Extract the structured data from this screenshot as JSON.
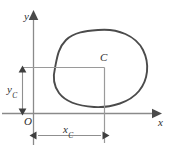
{
  "figure": {
    "kind": "diagram",
    "background_color": "#ffffff",
    "axes": {
      "x_axis_label": "x",
      "y_axis_label": "y",
      "origin_label": "O",
      "axis_color": "#8a8a8a",
      "arrowhead_color": "#4a4a4a"
    },
    "point": {
      "label": "C",
      "name": "centroid",
      "color": "#2e2e2e"
    },
    "dimensions": [
      {
        "id": "x-dimension",
        "label_base": "x",
        "label_subscript": "C",
        "orientation": "horizontal",
        "arrow_style": "double-headed",
        "color": "#8f8f8f"
      },
      {
        "id": "y-dimension",
        "label_base": "y",
        "label_subscript": "C",
        "orientation": "vertical",
        "arrow_style": "double-headed",
        "color": "#8f8f8f"
      }
    ],
    "shape": {
      "name": "closed-irregular-region",
      "stroke_color": "#4b4b4b",
      "fill": "none",
      "stroke_width": 1.9
    },
    "leader_lines": {
      "color": "#9a9a9a",
      "horizontal_from": "y-axis",
      "vertical_to": "x-dimension-line"
    }
  }
}
